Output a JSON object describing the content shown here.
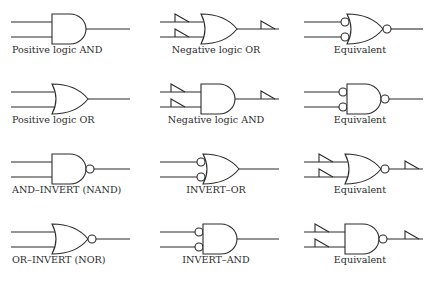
{
  "colors": {
    "stroke": "#2b2b2b",
    "text": "#2b2b2b",
    "background": "#ffffff"
  },
  "rows": [
    {
      "cells": [
        {
          "label": "Positive logic AND",
          "gate": "and",
          "input_bubbles": false,
          "output_bubble": false,
          "input_polarity": false,
          "output_polarity": false
        },
        {
          "label": "Negative logic OR",
          "gate": "or",
          "input_bubbles": false,
          "output_bubble": false,
          "input_polarity": true,
          "output_polarity": true
        },
        {
          "label": "Equivalent",
          "gate": "or",
          "input_bubbles": true,
          "output_bubble": true,
          "input_polarity": false,
          "output_polarity": false
        }
      ]
    },
    {
      "cells": [
        {
          "label": "Positive logic OR",
          "gate": "or",
          "input_bubbles": false,
          "output_bubble": false,
          "input_polarity": false,
          "output_polarity": false
        },
        {
          "label": "Negative logic AND",
          "gate": "and",
          "input_bubbles": false,
          "output_bubble": false,
          "input_polarity": true,
          "output_polarity": true
        },
        {
          "label": "Equivalent",
          "gate": "and",
          "input_bubbles": true,
          "output_bubble": true,
          "input_polarity": false,
          "output_polarity": false
        }
      ]
    },
    {
      "cells": [
        {
          "label": "AND–INVERT (NAND)",
          "gate": "and",
          "input_bubbles": false,
          "output_bubble": true,
          "input_polarity": false,
          "output_polarity": false
        },
        {
          "label": "INVERT–OR",
          "gate": "or",
          "input_bubbles": true,
          "output_bubble": false,
          "input_polarity": false,
          "output_polarity": false
        },
        {
          "label": "Equivalent",
          "gate": "or",
          "input_bubbles": false,
          "output_bubble": true,
          "input_polarity": true,
          "output_polarity": true
        }
      ]
    },
    {
      "cells": [
        {
          "label": "OR–INVERT (NOR)",
          "gate": "or",
          "input_bubbles": false,
          "output_bubble": true,
          "input_polarity": false,
          "output_polarity": false
        },
        {
          "label": "INVERT–AND",
          "gate": "and",
          "input_bubbles": true,
          "output_bubble": false,
          "input_polarity": false,
          "output_polarity": false
        },
        {
          "label": "Equivalent",
          "gate": "and",
          "input_bubbles": false,
          "output_bubble": true,
          "input_polarity": true,
          "output_polarity": true
        }
      ]
    }
  ]
}
